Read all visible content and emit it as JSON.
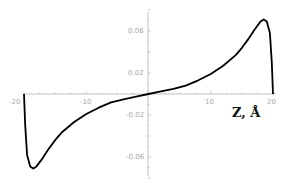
{
  "chart_data": {
    "type": "line",
    "title": "",
    "xlabel": "Z, Å",
    "ylabel": "",
    "xlim": [
      -20,
      20
    ],
    "ylim": [
      -0.08,
      0.08
    ],
    "grid": false,
    "legend": null,
    "x_ticks": [
      -20,
      -10,
      10,
      20
    ],
    "x_tick_labels": [
      "-20",
      "-10",
      "10",
      "20"
    ],
    "y_ticks": [
      0.06,
      0.02,
      -0.02,
      -0.06
    ],
    "y_tick_labels": [
      "0.06",
      "0.02",
      "-0.02",
      "-0.06"
    ],
    "series": [
      {
        "name": "curve",
        "color": "#000000",
        "x": [
          -20,
          -19.8,
          -19.5,
          -19.0,
          -18.5,
          -18.0,
          -17.0,
          -16.0,
          -15.0,
          -14.0,
          -12.0,
          -10.0,
          -8.0,
          -6.0,
          -4.0,
          -2.0,
          0,
          2.0,
          4.0,
          6.0,
          8.0,
          10.0,
          12.0,
          14.0,
          15.0,
          16.0,
          17.0,
          18.0,
          18.5,
          19.0,
          19.5,
          19.8,
          20
        ],
        "y": [
          0.0,
          -0.03,
          -0.058,
          -0.069,
          -0.071,
          -0.069,
          -0.061,
          -0.052,
          -0.044,
          -0.037,
          -0.027,
          -0.019,
          -0.013,
          -0.008,
          -0.005,
          -0.0025,
          0.0,
          0.0025,
          0.005,
          0.008,
          0.013,
          0.019,
          0.027,
          0.037,
          0.044,
          0.052,
          0.061,
          0.069,
          0.071,
          0.069,
          0.058,
          0.03,
          0.0
        ]
      }
    ]
  },
  "labels": {
    "x_axis_title": "Z, Å",
    "x_ticks": [
      "-20",
      "-10",
      "10",
      "20"
    ],
    "y_ticks": [
      "0.06",
      "0.02",
      "-0.02",
      "-0.06"
    ]
  }
}
